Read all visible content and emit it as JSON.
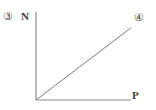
{
  "figure": {
    "left_marker": "③",
    "right_marker": "④",
    "background_color": "#ffffff",
    "axis_color": "#8a8a8a",
    "line_color": "#7a7a7a"
  },
  "chart_data": {
    "type": "line",
    "title": "",
    "subtitle": "",
    "xlabel": "P",
    "ylabel": "N",
    "xticklabels": [],
    "yticklabels": [],
    "grid": false,
    "legend": false,
    "legend_position": "none",
    "xlim": [
      0,
      10
    ],
    "ylim": [
      0,
      10
    ],
    "annotations": [
      "③",
      "④"
    ],
    "series": [
      {
        "name": "N vs P",
        "x": [
          0,
          10
        ],
        "y": [
          0,
          8.2
        ],
        "style": "straight-line-through-origin",
        "description": "N is directly proportional to P"
      }
    ]
  }
}
